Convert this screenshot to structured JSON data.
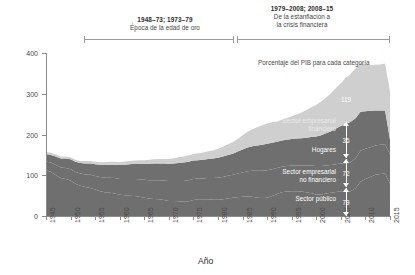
{
  "periods": [
    {
      "id": "left",
      "range": "1948–73; 1973–79",
      "desc": "Época de la edad de oro"
    },
    {
      "id": "right",
      "range": "1979–2008; 2008–15",
      "desc_line1": "De la estanflación a",
      "desc_line2": "la crisis financiera"
    }
  ],
  "annotations": {
    "percent_note": "Porcentaje del PIB para cada categoría"
  },
  "chart_data": {
    "type": "area",
    "title": "",
    "xlabel": "Año",
    "ylabel": "Deuda (% del PIB)",
    "xlim": [
      1945,
      2015
    ],
    "ylim": [
      0,
      400
    ],
    "yticks": [
      0,
      100,
      200,
      300,
      400
    ],
    "xticks": [
      1945,
      1950,
      1955,
      1960,
      1965,
      1970,
      1975,
      1980,
      1985,
      1990,
      1995,
      2000,
      2005,
      2010,
      2015
    ],
    "grid": false,
    "stacked": true,
    "legend_position": "inline-right",
    "x": [
      1945,
      1946,
      1947,
      1948,
      1949,
      1950,
      1951,
      1952,
      1953,
      1954,
      1955,
      1956,
      1957,
      1958,
      1959,
      1960,
      1961,
      1962,
      1963,
      1964,
      1965,
      1966,
      1967,
      1968,
      1969,
      1970,
      1971,
      1972,
      1973,
      1974,
      1975,
      1976,
      1977,
      1978,
      1979,
      1980,
      1981,
      1982,
      1983,
      1984,
      1985,
      1986,
      1987,
      1988,
      1989,
      1990,
      1991,
      1992,
      1993,
      1994,
      1995,
      1996,
      1997,
      1998,
      1999,
      2000,
      2001,
      2002,
      2003,
      2004,
      2005,
      2006,
      2007,
      2008,
      2009,
      2010,
      2011,
      2012,
      2013,
      2014,
      2015
    ],
    "series": [
      {
        "name": "Sector público",
        "color": "#6f6f6f",
        "values": [
          112,
          108,
          100,
          93,
          91,
          87,
          79,
          74,
          71,
          69,
          65,
          61,
          58,
          57,
          55,
          52,
          51,
          50,
          49,
          47,
          45,
          43,
          42,
          41,
          39,
          37,
          37,
          36,
          35,
          36,
          39,
          41,
          41,
          41,
          40,
          40,
          41,
          43,
          45,
          46,
          47,
          48,
          47,
          45,
          44,
          45,
          49,
          54,
          58,
          60,
          61,
          61,
          60,
          58,
          56,
          53,
          53,
          55,
          57,
          59,
          61,
          60,
          61,
          68,
          84,
          91,
          96,
          101,
          103,
          104,
          79
        ]
      },
      {
        "name": "Sector empresarial no financiero",
        "color": "#6f6f6f",
        "values": [
          22,
          23,
          25,
          26,
          27,
          28,
          29,
          30,
          31,
          32,
          33,
          35,
          36,
          37,
          38,
          39,
          40,
          41,
          42,
          43,
          44,
          45,
          46,
          47,
          48,
          49,
          49,
          50,
          51,
          52,
          52,
          51,
          51,
          52,
          53,
          54,
          55,
          56,
          56,
          58,
          60,
          62,
          64,
          66,
          67,
          67,
          66,
          64,
          63,
          63,
          63,
          63,
          64,
          66,
          68,
          70,
          70,
          69,
          68,
          68,
          68,
          69,
          71,
          74,
          76,
          74,
          73,
          72,
          72,
          72,
          72
        ]
      },
      {
        "name": "Hogares",
        "color": "#6f6f6f",
        "values": [
          18,
          19,
          21,
          22,
          23,
          24,
          25,
          26,
          27,
          28,
          29,
          30,
          31,
          32,
          33,
          34,
          35,
          36,
          37,
          38,
          39,
          40,
          41,
          41,
          42,
          42,
          43,
          44,
          45,
          45,
          45,
          45,
          46,
          47,
          48,
          49,
          50,
          51,
          52,
          54,
          56,
          58,
          60,
          62,
          64,
          65,
          65,
          64,
          64,
          64,
          65,
          66,
          67,
          68,
          70,
          72,
          75,
          79,
          83,
          88,
          92,
          96,
          99,
          98,
          96,
          92,
          89,
          86,
          84,
          83,
          36
        ]
      },
      {
        "name": "Sector empresarial financiero",
        "color": "#cfcfcf",
        "values": [
          5,
          5,
          5,
          5,
          5,
          5,
          5,
          5,
          6,
          6,
          6,
          6,
          7,
          7,
          7,
          7,
          8,
          8,
          8,
          9,
          9,
          10,
          10,
          11,
          11,
          12,
          13,
          14,
          15,
          16,
          16,
          17,
          18,
          19,
          20,
          22,
          24,
          26,
          28,
          31,
          35,
          39,
          42,
          45,
          48,
          50,
          50,
          50,
          51,
          53,
          56,
          59,
          63,
          68,
          73,
          78,
          83,
          88,
          93,
          99,
          105,
          112,
          119,
          122,
          119,
          115,
          112,
          112,
          113,
          115,
          119
        ]
      }
    ],
    "callouts": [
      {
        "label": "Sector empresarial financiero",
        "value": 119
      },
      {
        "label": "Hogares",
        "value": 36
      },
      {
        "label": "Sector empresarial no financiero",
        "value": 72
      },
      {
        "label": "Sector público",
        "value": 79
      }
    ]
  }
}
